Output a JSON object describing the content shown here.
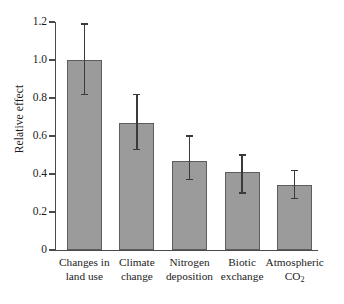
{
  "chart_data": {
    "type": "bar",
    "title": "",
    "subtitle": "",
    "xlabel": "",
    "ylabel": "Relative effect",
    "ylim": [
      0.0,
      1.2
    ],
    "ytick_step": 0.2,
    "ytick_labels": [
      "1.2",
      "1.0",
      "0.8",
      "0.6",
      "0.4",
      "0.2",
      "0"
    ],
    "ytick_values": [
      1.2,
      1.0,
      0.8,
      0.6,
      0.4,
      0.2,
      0.0
    ],
    "grid": false,
    "legend": null,
    "bar_color": "#9b9b9b",
    "bar_edge_color": "#5d5d5d",
    "error_color": "#3a3a3a",
    "axis_color": "#4a4a4a",
    "categories": [
      "Changes in land use",
      "Climate change",
      "Nitrogen deposition",
      "Biotic exchange",
      "Atmospheric CO2"
    ],
    "category_lines": [
      [
        "Changes in",
        "land use"
      ],
      [
        "Climate",
        "change"
      ],
      [
        "Nitrogen",
        "deposition"
      ],
      [
        "Biotic",
        "exchange"
      ],
      [
        "Atmospheric",
        "CO₂"
      ]
    ],
    "values": [
      1.0,
      0.67,
      0.47,
      0.41,
      0.34
    ],
    "error_low": [
      0.82,
      0.53,
      0.37,
      0.3,
      0.27
    ],
    "error_high": [
      1.19,
      0.82,
      0.6,
      0.5,
      0.42
    ]
  }
}
